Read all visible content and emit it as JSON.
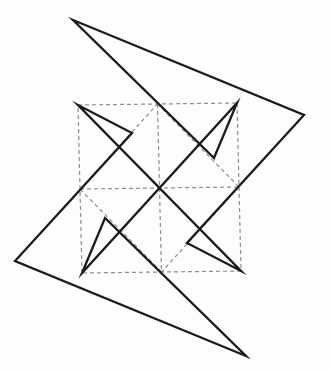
{
  "figure": {
    "kind": "line-diagram",
    "canvas": {
      "width": 331,
      "height": 371,
      "background": "#fdfdfc"
    },
    "style": {
      "solid_color": "#1b1b1b",
      "solid_width": 2.3,
      "dashed_color": "#8e8e8e",
      "dashed_width": 1.2,
      "dash_pattern": "4 3"
    },
    "points": {
      "A": [
        73,
        20
      ],
      "B": [
        304,
        115
      ],
      "C": [
        15,
        261
      ],
      "D": [
        246,
        356
      ],
      "TL": [
        78,
        105
      ],
      "TR": [
        237,
        103
      ],
      "BR": [
        241,
        271
      ],
      "BL": [
        82,
        273
      ],
      "iTL": [
        132,
        133
      ],
      "iTR": [
        214,
        158
      ],
      "iBR": [
        187,
        243
      ],
      "iBL": [
        105,
        218
      ],
      "TM": [
        157.5,
        104
      ],
      "RM": [
        239,
        187
      ],
      "BM": [
        161.5,
        272
      ],
      "LM": [
        80,
        189
      ]
    },
    "solid_closed_path": [
      "A",
      "B",
      "iBR",
      "BR",
      "TL",
      "iTL",
      "C",
      "D",
      "iBL",
      "BL",
      "TR",
      "iTR"
    ],
    "dashed_segments": [
      [
        "TL",
        "TR"
      ],
      [
        "TR",
        "BR"
      ],
      [
        "BR",
        "BL"
      ],
      [
        "BL",
        "TL"
      ],
      [
        "TM",
        "BM"
      ],
      [
        "LM",
        "RM"
      ],
      [
        "TM",
        "RM"
      ],
      [
        "RM",
        "BM"
      ],
      [
        "BM",
        "LM"
      ],
      [
        "LM",
        "TM"
      ]
    ]
  }
}
